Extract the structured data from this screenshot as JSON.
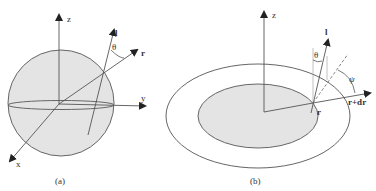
{
  "panels": [
    {
      "id": "a",
      "caption": "(a)",
      "shape": "sphere",
      "axes": {
        "z": "z",
        "y": "y",
        "x": "x"
      },
      "vectors": {
        "l": "l",
        "r": "r"
      },
      "angle": "θ"
    },
    {
      "id": "b",
      "caption": "(b)",
      "shape": "concentric ellipses",
      "axes": {
        "z": "z"
      },
      "vectors": {
        "l": "l",
        "r": "r",
        "r_dr": "r+dr"
      },
      "angles": {
        "theta": "θ",
        "psi": "ψ"
      }
    }
  ],
  "colors": {
    "fill": "#e4e4e4",
    "stroke": "#555555",
    "background": "#ffffff"
  }
}
